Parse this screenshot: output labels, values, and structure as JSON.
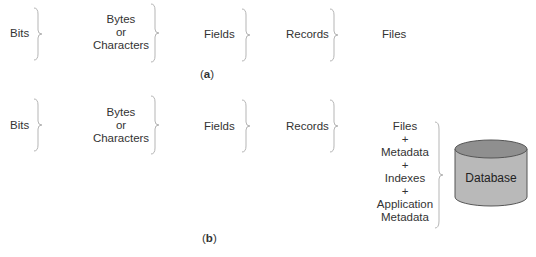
{
  "panel_a": {
    "caption_open": "(",
    "caption_letter": "a",
    "caption_close": ")",
    "items": [
      {
        "label": "Bits"
      },
      {
        "lines": [
          "Bytes",
          "or",
          "Characters"
        ]
      },
      {
        "label": "Fields"
      },
      {
        "label": "Records"
      },
      {
        "label": "Files"
      }
    ]
  },
  "panel_b": {
    "caption_open": "(",
    "caption_letter": "b",
    "caption_close": ")",
    "items": [
      {
        "label": "Bits"
      },
      {
        "lines": [
          "Bytes",
          "or",
          "Characters"
        ]
      },
      {
        "label": "Fields"
      },
      {
        "label": "Records"
      },
      {
        "lines": [
          "Files",
          "+",
          "Metadata",
          "+",
          "Indexes",
          "+",
          "Application",
          "Metadata"
        ]
      }
    ],
    "database": {
      "label": "Database",
      "fill": "#b9b9b9",
      "top_fill": "#8f8f8f"
    }
  },
  "colors": {
    "brace": "#b5b5b5",
    "text": "#333333"
  }
}
